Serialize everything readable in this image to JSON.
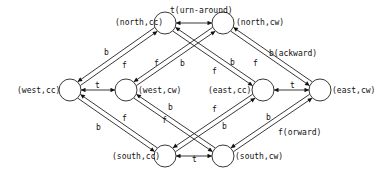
{
  "diagram": {
    "type": "state-transition-graph",
    "nodes": [
      {
        "id": "north_cc",
        "label": "(north,cc)"
      },
      {
        "id": "north_cw",
        "label": "(north,cw)"
      },
      {
        "id": "west_cc",
        "label": "(west,cc)"
      },
      {
        "id": "west_cw",
        "label": "(west,cw)"
      },
      {
        "id": "east_cc",
        "label": "(east,cc)"
      },
      {
        "id": "east_cw",
        "label": "(east,cw)"
      },
      {
        "id": "south_cc",
        "label": "(south,cc)"
      },
      {
        "id": "south_cw",
        "label": "(south,cw)"
      }
    ],
    "edges": [
      {
        "from": "north_cc",
        "to": "north_cw",
        "label": "t(urn-around)",
        "bidirectional": true
      },
      {
        "from": "west_cc",
        "to": "west_cw",
        "label": "t",
        "bidirectional": true
      },
      {
        "from": "east_cc",
        "to": "east_cw",
        "label": "t",
        "bidirectional": true
      },
      {
        "from": "south_cc",
        "to": "south_cw",
        "label": "t",
        "bidirectional": true
      },
      {
        "from": "west_cc",
        "to": "north_cc",
        "label": "b"
      },
      {
        "from": "north_cc",
        "to": "west_cc",
        "label": "f"
      },
      {
        "from": "west_cw",
        "to": "north_cw",
        "label": "f"
      },
      {
        "from": "north_cw",
        "to": "west_cw",
        "label": "b"
      },
      {
        "from": "north_cc",
        "to": "east_cc",
        "label": "f"
      },
      {
        "from": "east_cc",
        "to": "north_cc",
        "label": "b"
      },
      {
        "from": "east_cw",
        "to": "north_cw",
        "label": "b(ackward)"
      },
      {
        "from": "north_cw",
        "to": "east_cw",
        "label": "f"
      },
      {
        "from": "west_cc",
        "to": "south_cc",
        "label": "f"
      },
      {
        "from": "south_cc",
        "to": "west_cc",
        "label": "b"
      },
      {
        "from": "south_cw",
        "to": "west_cw",
        "label": "f"
      },
      {
        "from": "west_cw",
        "to": "south_cw",
        "label": "b"
      },
      {
        "from": "south_cc",
        "to": "east_cc",
        "label": "f"
      },
      {
        "from": "east_cc",
        "to": "south_cc",
        "label": "b"
      },
      {
        "from": "south_cw",
        "to": "east_cw",
        "label": "b"
      },
      {
        "from": "east_cw",
        "to": "south_cw",
        "label": "f(orward)"
      }
    ]
  }
}
